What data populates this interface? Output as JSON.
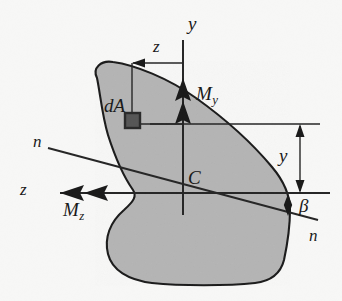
{
  "figure": {
    "type": "engineering-cross-section-diagram",
    "background_color": "#f7f7f6",
    "section_fill_color": "#b4b4b4",
    "section_outline_color": "#1a1a1a",
    "line_color": "#262626",
    "element_fill_color": "#565656",
    "element_border_color": "#2a2a2a"
  },
  "labels": {
    "y_axis": "y",
    "z_axis": "z",
    "centroid": "C",
    "area_element": "dA",
    "moment_y": "M",
    "moment_y_sub": "y",
    "moment_z": "M",
    "moment_z_sub": "z",
    "distance_z": "z",
    "distance_y": "y",
    "neutral_axis_left": "n",
    "neutral_axis_right": "n",
    "angle_beta": "β"
  },
  "geometry": {
    "centroid_point": {
      "x": 183,
      "y": 193
    },
    "area_element_point": {
      "x": 132,
      "y": 120
    },
    "area_element_size": 14,
    "y_axis_top": 40,
    "y_axis_bottom": 215,
    "z_axis_left": 48,
    "z_axis_right": 330,
    "neutral_axis_angle_deg": 15,
    "dimension_z_line_y": 63,
    "dimension_y_line_x": 300
  }
}
